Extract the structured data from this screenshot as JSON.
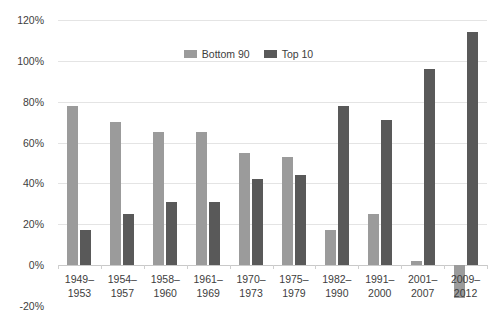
{
  "chart_data": {
    "type": "bar",
    "title": "",
    "subtitle": "",
    "xlabel": "",
    "ylabel": "",
    "ylim": [
      -20,
      120
    ],
    "yticks": [
      "-20%",
      "0%",
      "20%",
      "40%",
      "60%",
      "80%",
      "100%",
      "120%"
    ],
    "ytick_values": [
      -20,
      0,
      20,
      40,
      60,
      80,
      100,
      120
    ],
    "grid": true,
    "legend_position": "top-center",
    "categories": [
      "1949–1953",
      "1954–1957",
      "1958–1960",
      "1961–1969",
      "1970–1973",
      "1975–1979",
      "1982–1990",
      "1991–2000",
      "2001–2007",
      "2009–2012"
    ],
    "category_lines": [
      [
        "1949–",
        "1953"
      ],
      [
        "1954–",
        "1957"
      ],
      [
        "1958–",
        "1960"
      ],
      [
        "1961–",
        "1969"
      ],
      [
        "1970–",
        "1973"
      ],
      [
        "1975–",
        "1979"
      ],
      [
        "1982–",
        "1990"
      ],
      [
        "1991–",
        "2000"
      ],
      [
        "2001–",
        "2007"
      ],
      [
        "2009–",
        "2012"
      ]
    ],
    "series": [
      {
        "name": "Bottom 90",
        "color": "#9b9b9b",
        "values": [
          78,
          70,
          65,
          65,
          55,
          53,
          17,
          25,
          2,
          -16
        ]
      },
      {
        "name": "Top 10",
        "color": "#595959",
        "values": [
          17,
          25,
          31,
          31,
          42,
          44,
          78,
          71,
          96,
          114
        ]
      }
    ]
  },
  "legend": {
    "items": [
      {
        "label": "Bottom 90",
        "color": "#9b9b9b"
      },
      {
        "label": "Top 10",
        "color": "#595959"
      }
    ]
  },
  "colors": {
    "bottom90": "#9b9b9b",
    "top10": "#595959",
    "gridline": "#e4e4e4",
    "axis": "#c9c9c9",
    "text": "#3d3d3d",
    "background": "#ffffff"
  }
}
